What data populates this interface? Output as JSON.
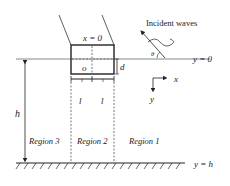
{
  "diagram": {
    "labels": {
      "incident_waves": "Incident waves",
      "theta": "θ",
      "x_equals_zero": "x = 0",
      "y_surface": "y = 0",
      "y_bottom": "y = h",
      "origin": "o",
      "draft": "d",
      "half_width_left": "l",
      "half_width_right": "l",
      "depth": "h",
      "x_axis": "x",
      "y_axis": "y"
    },
    "regions": [
      {
        "id": 3,
        "label": "Region 3"
      },
      {
        "id": 2,
        "label": "Region 2"
      },
      {
        "id": 1,
        "label": "Region 1"
      }
    ],
    "colors": {
      "stroke": "#222222",
      "surface_line": "#888888",
      "dashed": "#555555",
      "text": "#222222"
    }
  }
}
